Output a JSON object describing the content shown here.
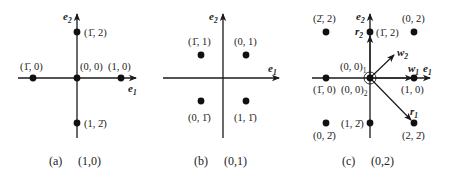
{
  "figure": {
    "panels": [
      {
        "id": "a",
        "caption_letter": "(a)",
        "caption_value": "(1,0)",
        "axes": {
          "origin": [
            77,
            78
          ],
          "h": [
            18,
            136
          ],
          "v": [
            15,
            138
          ],
          "e1_label": "e",
          "e1_sub": "1",
          "e2_label": "e",
          "e2_sub": "2"
        },
        "points": [
          {
            "label": "(1̄, 2)",
            "x": 77,
            "y": 32
          },
          {
            "label": "(1̄, 0)",
            "x": 33,
            "y": 78
          },
          {
            "label": "(0, 0)",
            "x": 77,
            "y": 78
          },
          {
            "label": "(1, 0)",
            "x": 121,
            "y": 78
          },
          {
            "label": "(1, 2̄)",
            "x": 77,
            "y": 123
          }
        ]
      },
      {
        "id": "b",
        "caption_letter": "(b)",
        "caption_value": "(0,1)",
        "axes": {
          "origin": [
            223,
            78
          ],
          "h": [
            163,
            279
          ],
          "v": [
            15,
            138
          ],
          "e1_label": "e",
          "e1_sub": "1",
          "e2_label": "e",
          "e2_sub": "2"
        },
        "points": [
          {
            "label": "(1̄, 1)",
            "x": 201,
            "y": 55
          },
          {
            "label": "(0, 1)",
            "x": 246,
            "y": 55
          },
          {
            "label": "(0, 1̄)",
            "x": 201,
            "y": 101
          },
          {
            "label": "(1, 1̄)",
            "x": 246,
            "y": 101
          }
        ]
      },
      {
        "id": "c",
        "caption_letter": "(c)",
        "caption_value": "(0,2)",
        "axes": {
          "origin": [
            370,
            78
          ],
          "h": [
            312,
            430
          ],
          "v": [
            15,
            138
          ],
          "e1_label": "e",
          "e1_sub": "1",
          "e2_label": "e",
          "e2_sub": "2"
        },
        "points": [
          {
            "label": "(2̄, 2)",
            "x": 326,
            "y": 32
          },
          {
            "label": "(1̄, 2)",
            "x": 370,
            "y": 32
          },
          {
            "label": "(0, 2)",
            "x": 414,
            "y": 32
          },
          {
            "label": "(1̄, 0)",
            "x": 326,
            "y": 78
          },
          {
            "label": "(1, 0)",
            "x": 414,
            "y": 78
          },
          {
            "label": "(0, 2̄)",
            "x": 326,
            "y": 123
          },
          {
            "label": "(1, 2̄)",
            "x": 370,
            "y": 123
          },
          {
            "label": "(2, 2̄)",
            "x": 414,
            "y": 123
          }
        ],
        "origin_labels": {
          "upper": "(0, 0)",
          "upper_sub": "1",
          "lower": "(0, 0)",
          "lower_sub": "2"
        },
        "vectors": [
          {
            "name": "w",
            "sub": "2",
            "from": [
              370,
              78
            ],
            "to": [
              394,
              55
            ]
          },
          {
            "name": "w",
            "sub": "1",
            "from": [
              370,
              78
            ],
            "to": [
              412,
              78
            ]
          },
          {
            "name": "r",
            "sub": "1",
            "from": [
              370,
              78
            ],
            "to": [
              412,
              121
            ]
          },
          {
            "name": "r",
            "sub": "2",
            "from": [
              370,
              78
            ],
            "to": [
              370,
              34
            ]
          }
        ]
      }
    ]
  }
}
